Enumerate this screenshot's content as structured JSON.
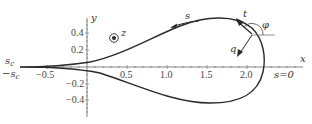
{
  "diagram": {
    "type": "parametric-curve",
    "axes": {
      "x_label": "x",
      "y_label": "y",
      "x_ticks": [
        "−0.5",
        "0.5",
        "1.0",
        "1.5",
        "2.0"
      ],
      "y_ticks": [
        "0.4",
        "0.2",
        "−0.2",
        "−0.4"
      ]
    },
    "annotations": {
      "z_axis": "z",
      "arc_length": "s",
      "tangent": "t",
      "angle": "φ",
      "normal": "q",
      "s_start": "s=0",
      "s_c_upper": "s",
      "s_c_upper_sub": "c",
      "s_c_lower": "−s",
      "s_c_lower_sub": "c"
    },
    "colors": {
      "curve": "#2a2a2a",
      "axis": "#555555",
      "text": "#333333"
    }
  }
}
